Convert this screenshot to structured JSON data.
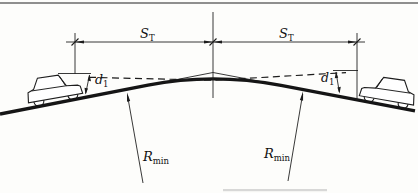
{
  "diagram": {
    "background": "#fdfdfb",
    "ink_color": "#1c1c1c",
    "dimensions": {
      "sight_left": {
        "base": "S",
        "sub": "T"
      },
      "sight_right": {
        "base": "S",
        "sub": "T"
      },
      "eye_height_left": {
        "base": "d",
        "sub": "1"
      },
      "eye_height_right": {
        "base": "d",
        "sub": "1"
      },
      "radius_left": {
        "base": "R",
        "sub": "min"
      },
      "radius_right": {
        "base": "R",
        "sub": "min"
      }
    }
  }
}
